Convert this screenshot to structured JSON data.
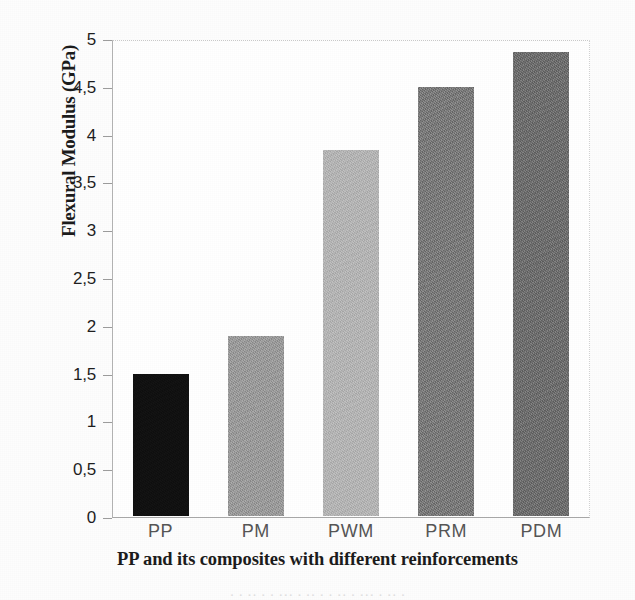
{
  "chart_data": {
    "type": "bar",
    "title": "",
    "subtitle": "",
    "xlabel": "PP and its composites with different reinforcements",
    "ylabel": "Flexural Modulus (GPa)",
    "categories": [
      "PP",
      "PM",
      "PWM",
      "PRM",
      "PDM"
    ],
    "values": [
      1.49,
      1.89,
      3.85,
      4.52,
      4.88
    ],
    "series": [
      {
        "name": "Flexural Modulus",
        "values": [
          1.49,
          1.89,
          3.85,
          4.52,
          4.88
        ]
      }
    ],
    "bar_colors": [
      "#111111",
      "#9b9b9b",
      "#b5b5b5",
      "#7b7b7b",
      "#6f6f6f"
    ],
    "ylim": [
      0,
      5
    ],
    "ytick_step": 0.5,
    "ytick_labels": [
      "5",
      "4,5",
      "4",
      "3,5",
      "3",
      "2,5",
      "2",
      "1,5",
      "1",
      "0,5",
      "0"
    ],
    "ytick_values": [
      5,
      4.5,
      4,
      3.5,
      3,
      2.5,
      2,
      1.5,
      1,
      0.5,
      0
    ],
    "decimal_separator": ",",
    "grid": false,
    "legend": false,
    "legend_position": "none",
    "plot_border": true,
    "annotations": []
  },
  "caption": {
    "remnant_text": "· ·  ·· ·  · ···  · ·· ·   ·  ··  · ··· ·  ·· ·"
  }
}
